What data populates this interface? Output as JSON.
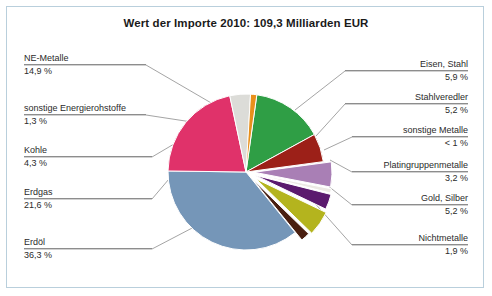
{
  "chart_data": {
    "type": "pie",
    "title": "Wert der Importe 2010: 109,3 Milliarden EUR",
    "total_label": "109,3 Milliarden EUR",
    "year": "2010",
    "unit": "%",
    "legend_position": "callout-labels",
    "grid": false,
    "categories": [
      "NE-Metalle",
      "Eisen, Stahl",
      "Stahlveredler",
      "sonstige Metalle",
      "Platingruppenmetalle",
      "Gold, Silber",
      "Nichtmetalle",
      "Erdöl",
      "Erdgas",
      "Kohle",
      "sonstige Energierohstoffe"
    ],
    "values": [
      14.9,
      5.9,
      5.2,
      0.9,
      3.2,
      5.2,
      1.9,
      36.3,
      21.6,
      4.3,
      1.3
    ],
    "value_labels": [
      "14,9 %",
      "5,9 %",
      "5,2 %",
      "< 1 %",
      "3,2 %",
      "5,2 %",
      "1,9 %",
      "36,3 %",
      "21,6 %",
      "4,3 %",
      "1,3 %"
    ],
    "colors": [
      "#2f9e45",
      "#9c2018",
      "#a97fb5",
      "#ece9e4",
      "#5b1a6e",
      "#b4b41e",
      "#4a1f10",
      "#7596b8",
      "#e0326a",
      "#dcdcd8",
      "#e8901c"
    ]
  },
  "slices": [
    {
      "label": "NE-Metalle",
      "value_label": "14,9 %",
      "color": "#2f9e45"
    },
    {
      "label": "Eisen, Stahl",
      "value_label": "5,9 %",
      "color": "#9c2018"
    },
    {
      "label": "Stahlveredler",
      "value_label": "5,2 %",
      "color": "#a97fb5"
    },
    {
      "label": "sonstige Metalle",
      "value_label": "< 1 %",
      "color": "#ece9e4"
    },
    {
      "label": "Platingruppenmetalle",
      "value_label": "3,2 %",
      "color": "#5b1a6e"
    },
    {
      "label": "Gold, Silber",
      "value_label": "5,2 %",
      "color": "#b4b41e"
    },
    {
      "label": "Nichtmetalle",
      "value_label": "1,9 %",
      "color": "#4a1f10"
    },
    {
      "label": "Erdöl",
      "value_label": "36,3 %",
      "color": "#7596b8"
    },
    {
      "label": "Erdgas",
      "value_label": "21,6 %",
      "color": "#e0326a"
    },
    {
      "label": "Kohle",
      "value_label": "4,3 %",
      "color": "#dcdcd8"
    },
    {
      "label": "sonstige Energierohstoffe",
      "value_label": "1,3 %",
      "color": "#e8901c"
    }
  ],
  "style": {
    "border_color": "#b9cfdc",
    "leader_color": "#8d8d8d",
    "text_color": "#2b2b2b"
  }
}
